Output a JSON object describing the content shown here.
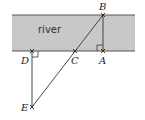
{
  "diagram": {
    "river": {
      "label": "river",
      "fill": "#c8c8c8",
      "edge": "#555555",
      "x": 12,
      "y": 15,
      "width": 123,
      "height": 36
    },
    "points": {
      "A": {
        "label": "A",
        "x": 103,
        "y": 51
      },
      "B": {
        "label": "B",
        "x": 103,
        "y": 15
      },
      "C": {
        "label": "C",
        "x": 75,
        "y": 51
      },
      "D": {
        "label": "D",
        "x": 32,
        "y": 51
      },
      "E": {
        "label": "E",
        "x": 32,
        "y": 107
      }
    },
    "segments": [
      {
        "from": "B",
        "to": "A"
      },
      {
        "from": "B",
        "to": "E"
      },
      {
        "from": "D",
        "to": "E"
      }
    ],
    "right_angles": [
      "A",
      "D"
    ],
    "line_color": "#333333"
  }
}
